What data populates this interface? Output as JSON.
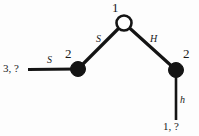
{
  "diagram": {
    "background_color": "#fdfdfd",
    "stroke_color": "#141414",
    "nodes": [
      {
        "id": "apex",
        "label": "1",
        "style": "open-circle",
        "fill": "#ffffff",
        "x": 124,
        "y": 23,
        "r": 7
      },
      {
        "id": "left",
        "label": "2",
        "style": "filled-circle",
        "fill": "#141414",
        "x": 78,
        "y": 69,
        "r": 7
      },
      {
        "id": "right",
        "label": "2",
        "style": "filled-circle",
        "fill": "#141414",
        "x": 176,
        "y": 70,
        "r": 7
      }
    ],
    "edges": [
      {
        "id": "edge-left-terminal",
        "label": "S",
        "from": "terminal-left",
        "to": "left"
      },
      {
        "id": "edge-left-apex",
        "label": "S",
        "from": "left",
        "to": "apex"
      },
      {
        "id": "edge-apex-right",
        "label": "H",
        "from": "apex",
        "to": "right"
      },
      {
        "id": "edge-right-terminal",
        "label": "h",
        "from": "right",
        "to": "terminal-bottom"
      }
    ],
    "terminals": [
      {
        "id": "terminal-left",
        "label": "3, ?",
        "x": 4,
        "y": 63
      },
      {
        "id": "terminal-bottom",
        "label": "1, ?",
        "x": 163,
        "y": 122
      }
    ],
    "node_label_positions": [
      {
        "id": "apex",
        "text": "1",
        "x": 112,
        "y": 2
      },
      {
        "id": "left",
        "text": "2",
        "x": 65,
        "y": 48
      },
      {
        "id": "right",
        "text": "2",
        "x": 183,
        "y": 48
      }
    ],
    "edge_label_positions": [
      {
        "id": "edge-left-terminal",
        "text": "S",
        "x": 47,
        "y": 57
      },
      {
        "id": "edge-left-apex",
        "text": "S",
        "x": 96,
        "y": 35
      },
      {
        "id": "edge-apex-right",
        "text": "H",
        "x": 150,
        "y": 35
      },
      {
        "id": "edge-right-terminal",
        "text": "h",
        "x": 180,
        "y": 97
      }
    ]
  }
}
